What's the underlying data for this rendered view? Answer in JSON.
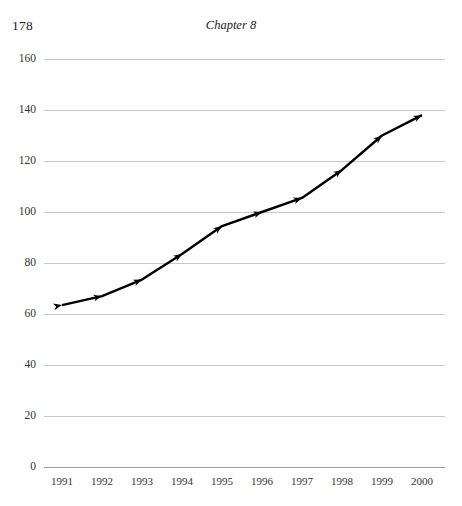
{
  "page": {
    "folio": "178",
    "running_head": "Chapter 8"
  },
  "chart_data": {
    "type": "line",
    "title": "",
    "subtitle": "",
    "xlabel": "",
    "ylabel": "",
    "categories": [
      "1991",
      "1992",
      "1993",
      "1994",
      "1995",
      "1996",
      "1997",
      "1998",
      "1999",
      "2000"
    ],
    "values": [
      63.5,
      67,
      73.5,
      83.5,
      94.5,
      100,
      105.5,
      116.5,
      130,
      138
    ],
    "series": [
      {
        "name": "",
        "values": [
          63.5,
          67,
          73.5,
          83.5,
          94.5,
          100,
          105.5,
          116.5,
          130,
          138
        ]
      }
    ],
    "ylim": [
      0,
      160
    ],
    "xlim": [
      "1991",
      "2000"
    ],
    "ytick_labels": [
      "0",
      "20",
      "40",
      "60",
      "80",
      "100",
      "120",
      "140",
      "160"
    ],
    "ytick_values": [
      0,
      20,
      40,
      60,
      80,
      100,
      120,
      140,
      160
    ],
    "xtick_labels": [
      "1991",
      "1992",
      "1993",
      "1994",
      "1995",
      "1996",
      "1997",
      "1998",
      "1999",
      "2000"
    ],
    "grid": true,
    "grid_axis": "y",
    "legend": false,
    "legend_position": "none",
    "marker": "arrow-head",
    "line_color": "#000000",
    "grid_color": "#c9c9c9",
    "axis_color": "#9e9e9e",
    "annotations": []
  },
  "colors": {
    "background": "#ffffff",
    "text": "#1b1b1b",
    "tick_text": "#333333",
    "line": "#000000",
    "grid": "#c9c9c9"
  }
}
